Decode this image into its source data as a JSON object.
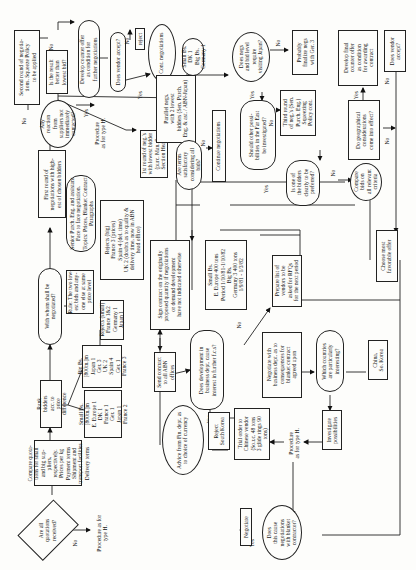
{
  "orientation": "rotated-90-ccw",
  "nodes": {
    "all_quotations": "Are all\nquotations\nreceived?",
    "proc_type_h_start": "Procedure as for\ntype H.",
    "compare_quotations": "Compare quota-\ntions for small\nand big sup-\npliers,\nrespectively.\nPrices per kg\nPayment terms\nShipment and\ntransport facilities\nDelivery terms",
    "rank_bidders": "Rank\nbidders\nacc. to\nprice\ndifference",
    "small_bs_list": "Small Bs.\n[800tn.]m\nE. Europe 1\nDK 1\nFrance 1\nGer. 1\nJapan 1\nFrance 2",
    "big_bs_list": "Big Bs.\n[800tn.]m\nJapan 1\nGer. 3\nUK 2\nSpain 4\nGer. 1\nFrance 3",
    "rejects_small": "Rejects (small)\nFrance 1&2\nGermany 1\nJapan 1",
    "with_whom": "With whom shall be\nnegotiated?",
    "rule_two_lowest": "Rule: The two low-\nest bids and any-\none else at same\nprice level",
    "senior_purch": "Senior Purch. Eng. and assistant\nFace to face negotiation.\nTopics: Prices, Blanket Contract\nParagraphs",
    "rejects_big": "Rejects (big)\nFrance 3 (prices)\nSpain 4 (del. time)\nUK 2 (doubts as to quality &\ndelivery time, now in ABN\nhead office)",
    "first_round": "First round of\nnegotiations with high-\nest of chosen bidders",
    "any_reaction": "Any\nreaction\nfrom\nsuppliers not\nimmediately\ncontacted?",
    "proc_type_h_reaction": "Procedure\nas for type H.",
    "second_round": "Second round of negotia-\ntions. Squeeze Policy\nto be applied",
    "is_result_better": "Is the result\nbetter than\nlowest bid?",
    "develop_counter": "Develop counter offer\nas condition for\nfurther negotiations",
    "does_vendor_accept_1": "Does vendor accept?",
    "reject": "reject",
    "cont_negotiations": "Cont. negotiations",
    "small_big_bs_result": "Small Bs.\nDK 1\nBig Bs.\nGermany 1",
    "first_round_lowest": "1st round of neg.'s\nwith lowest bidder\n(purc. Man. &\nSection Head)",
    "parallel_negs": "Parallel negs.\nwith 2 lowest\nbidders (Sen. Purch.\nEng. & ast. / ABN-Japan)",
    "are_terms_satisfactory": "Are terms\nsatisfactory\nconsidering all\nbids?",
    "continue_negotiations": "Continue negotiations",
    "does_negs_require_visit": "Does negs\nand bid level\nrequire\nvisiting Japan?",
    "probably_finalize": "Probably\nfinalize negs\nwith Ger. 3",
    "other_possibilities": "Should other possi-\nbilities in the Far East\nbe investigated?",
    "third_round": "Third round\nof neg.'s (Sen.\nPurch. Eng.)\nSqueezing\nPolicy cont.",
    "is_one_preferred": "Is one of\nthe bidders\nclearly to be\npreferred?",
    "compare_bids": "Compare\nbids on\nall relevant\ncriteria",
    "geographical": "Do geographical\nconsiderations\ncome into effect?",
    "develop_final_counter": "Develop final\ncounter offer\nas condition\nfor awarding\ncontract",
    "does_vendor_accept_2": "Does vendor\naccept?",
    "choose_most_favorable": "Choose most\nfavorable offer",
    "sign_contract": "Sign contract on the originally\nproposed quantity if negotiations\nor demand development\nhave not indicated otherwise",
    "send_contract": "Send contract\nto all ABN\noffices",
    "advice_fin_dept": "Advice from Fin. dept. as\nto choice of currency",
    "small_big_contract": "Small Bs.\nE. Europe 400 tons\nPeriod 1/10/81-1/10/82\nBig Bs.\nGermany 3 400 tons\n1/9/81 - 1/3/82",
    "does_development": "Does development in\nbusiness dept. cause\ninterest in further f.c.s?",
    "prepare_list": "Prepare list of\nvendors to be\nasked for RFQs\nfor the next period",
    "negotiate_business": "Negotiate with\nbusiness dept. as to\nconsequences for\nblanket contract\nagreed upon",
    "which_countries": "Which countries\nare particularly\ninteresting?",
    "china_korea": "China,\nSo. Korea",
    "investigate": "Investigate\npossibilities",
    "proc_type_h_invest": "Procedure\nas for type H.",
    "reject_south_korea": "Reject\nSouth Korea",
    "trial_order": "Trial order to\nChinese vendor\n(So.r.c. 48 tons\n3 glide rings 90\ntons)",
    "does_this_cause": "Does\nthis cause\nnegotiations\nwith blanket\ncontractor?",
    "negotiate": "Negotiate"
  },
  "edge_labels": {
    "yes": "Yes",
    "no": "No"
  }
}
